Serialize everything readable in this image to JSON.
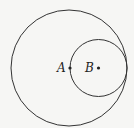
{
  "diagram": {
    "background": "#f6f6f4",
    "stroke": "#333333",
    "circles": [
      {
        "name": "outer-circle",
        "cx": 69,
        "cy": 68,
        "r": 58
      },
      {
        "name": "inner-circle",
        "cx": 98.5,
        "cy": 68,
        "r": 28.5
      }
    ],
    "points": [
      {
        "label": "A",
        "x": 70,
        "y": 68
      },
      {
        "label": "B",
        "x": 98.5,
        "y": 68
      }
    ]
  }
}
